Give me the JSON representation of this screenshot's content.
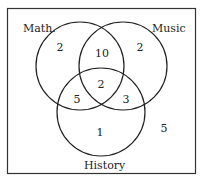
{
  "diagram": {
    "type": "venn",
    "sets": [
      {
        "name": "Math.",
        "cx": 80,
        "cy": 66,
        "r": 44,
        "label_x": 23,
        "label_y": 32
      },
      {
        "name": "Music",
        "cx": 123,
        "cy": 66,
        "r": 44,
        "label_x": 152,
        "label_y": 32
      },
      {
        "name": "History",
        "cx": 101,
        "cy": 112,
        "r": 44,
        "label_x": 84,
        "label_y": 169
      }
    ],
    "regions": [
      {
        "name": "math-only",
        "value": "2",
        "x": 60,
        "y": 51
      },
      {
        "name": "math-music",
        "value": "10",
        "x": 102,
        "y": 57
      },
      {
        "name": "music-only",
        "value": "2",
        "x": 140,
        "y": 51
      },
      {
        "name": "all-three",
        "value": "2",
        "x": 101,
        "y": 88
      },
      {
        "name": "math-history",
        "value": "5",
        "x": 77,
        "y": 103
      },
      {
        "name": "music-history",
        "value": "3",
        "x": 126,
        "y": 103
      },
      {
        "name": "history-only",
        "value": "1",
        "x": 100,
        "y": 136
      },
      {
        "name": "outside",
        "value": "5",
        "x": 164,
        "y": 132
      }
    ]
  }
}
